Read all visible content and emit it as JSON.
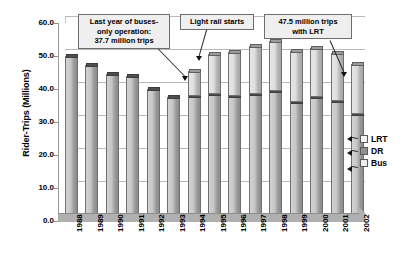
{
  "chart_data": {
    "type": "bar",
    "subtype": "stacked-column-3d",
    "title": "",
    "xlabel": "",
    "ylabel": "Rider-Trips (Millions)",
    "ylim": [
      0.0,
      60.0
    ],
    "ytick_labels": [
      "60.0",
      "50.0",
      "40.0",
      "30.0",
      "20.0",
      "10.0",
      "0.0"
    ],
    "ytick_values": [
      60.0,
      50.0,
      40.0,
      30.0,
      20.0,
      10.0,
      0.0
    ],
    "grid": true,
    "legend_position": "right",
    "categories": [
      "1988",
      "1989",
      "1990",
      "1991",
      "1992",
      "1993",
      "1994",
      "1995",
      "1996",
      "1997",
      "1998",
      "1999",
      "2000",
      "2001",
      "2002"
    ],
    "series": [
      {
        "name": "Bus",
        "values": [
          49.9,
          47.2,
          44.6,
          43.8,
          40.0,
          37.7,
          37.8,
          38.4,
          37.9,
          38.4,
          39.4,
          36.1,
          37.6,
          36.5,
          32.3
        ]
      },
      {
        "name": "LRT",
        "values": [
          0.0,
          0.0,
          0.0,
          0.0,
          0.0,
          0.0,
          7.7,
          12.2,
          13.2,
          14.5,
          15.1,
          15.4,
          14.7,
          14.5,
          15.2
        ]
      }
    ],
    "totals": [
      49.9,
      47.2,
      44.6,
      43.8,
      40.0,
      37.7,
      45.5,
      50.6,
      51.1,
      52.9,
      54.5,
      51.5,
      52.3,
      51.0,
      47.5
    ],
    "annotations": [
      {
        "id": "buses-only",
        "text": "Last year of buses-only operation: 37.7 million trips",
        "lines": [
          "Last year of buses-",
          "only operation:",
          "37.7 million trips"
        ],
        "points_to_category": "1993",
        "points_to_value": 37.7
      },
      {
        "id": "light-rail-starts",
        "text": "Light rail starts",
        "lines": [
          "Light rail starts"
        ],
        "points_to_category": "1994",
        "points_to_value": 45.5
      },
      {
        "id": "lrt-total",
        "text": "47.5 million trips with LRT",
        "lines": [
          "47.5 million trips",
          "with LRT"
        ],
        "points_to_category": "2002",
        "points_to_value": 47.5
      }
    ]
  },
  "legend": {
    "items": [
      {
        "label": "LRT",
        "swatch": "lrt-swatch"
      },
      {
        "label": "DR",
        "swatch": "dr-swatch"
      },
      {
        "label": "Bus",
        "swatch": "bus-swatch"
      }
    ]
  },
  "colors": {
    "bus_fill": "#c6c6c6",
    "lrt_fill": "#dedede",
    "dr_fill": "#8f8f8f",
    "grid": "#b9b9b9",
    "axis": "#8d8d8d",
    "callout_bg": "#efefef",
    "callout_border": "#6d6d6d"
  }
}
